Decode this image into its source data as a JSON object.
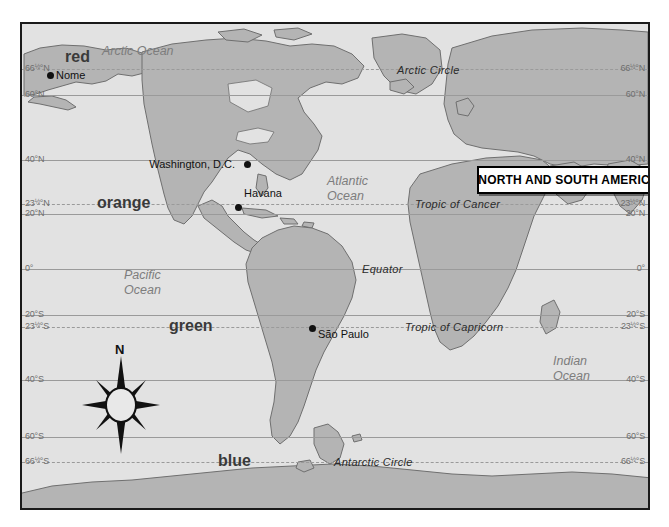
{
  "map": {
    "title": "NORTH AND SOUTH AMERICA",
    "projection_note": "world map, Americas centered",
    "colors": {
      "ocean": "#e2e2e2",
      "land": "#b4b4b4",
      "coastline": "#6f6f6f",
      "gridline": "#9a9a9a",
      "frame": "#1a1a1a",
      "label_gray": "#7d7d7d",
      "text_black": "#111111"
    },
    "latitude_labels": [
      {
        "id": "arctic-circle",
        "text": "66½°N",
        "deg": "66",
        "frac": "½",
        "suffix": "°N",
        "y": 45,
        "dashed": true
      },
      {
        "id": "lat-60n",
        "text": "60°N",
        "deg": "60",
        "frac": "",
        "suffix": "°N",
        "y": 71,
        "dashed": false
      },
      {
        "id": "lat-40n",
        "text": "40°N",
        "deg": "40",
        "frac": "",
        "suffix": "°N",
        "y": 136,
        "dashed": false
      },
      {
        "id": "tropic-cancer",
        "text": "23½°N",
        "deg": "23",
        "frac": "½",
        "suffix": "°N",
        "y": 180,
        "dashed": true
      },
      {
        "id": "lat-20n",
        "text": "20°N",
        "deg": "20",
        "frac": "",
        "suffix": "°N",
        "y": 190,
        "dashed": false
      },
      {
        "id": "equator",
        "text": "0°",
        "deg": "0",
        "frac": "",
        "suffix": "°",
        "y": 245,
        "dashed": false
      },
      {
        "id": "lat-20s",
        "text": "20°S",
        "deg": "20",
        "frac": "",
        "suffix": "°S",
        "y": 291,
        "dashed": false
      },
      {
        "id": "tropic-capricorn",
        "text": "23½°S",
        "deg": "23",
        "frac": "½",
        "suffix": "°S",
        "y": 303,
        "dashed": true
      },
      {
        "id": "lat-40s",
        "text": "40°S",
        "deg": "40",
        "frac": "",
        "suffix": "°S",
        "y": 356,
        "dashed": false
      },
      {
        "id": "lat-60s",
        "text": "60°S",
        "deg": "60",
        "frac": "",
        "suffix": "°S",
        "y": 413,
        "dashed": false
      },
      {
        "id": "antarctic-circle",
        "text": "66½°S",
        "deg": "66",
        "frac": "½",
        "suffix": "°S",
        "y": 438,
        "dashed": true
      }
    ],
    "oceans": [
      {
        "id": "arctic-ocean",
        "name_line1": "Arctic Ocean",
        "name_line2": "",
        "x": 80,
        "y": 20
      },
      {
        "id": "atlantic-ocean",
        "name_line1": "Atlantic",
        "name_line2": "Ocean",
        "x": 305,
        "y": 150
      },
      {
        "id": "pacific-ocean",
        "name_line1": "Pacific",
        "name_line2": "Ocean",
        "x": 102,
        "y": 244
      },
      {
        "id": "indian-ocean",
        "name_line1": "Indian",
        "name_line2": "Ocean",
        "x": 531,
        "y": 330
      }
    ],
    "line_labels": [
      {
        "id": "arctic-circle-label",
        "text": "Arctic Circle",
        "x": 375,
        "y": 40
      },
      {
        "id": "tropic-cancer-label",
        "text": "Tropic of Cancer",
        "x": 393,
        "y": 174
      },
      {
        "id": "equator-label",
        "text": "Equator",
        "x": 340,
        "y": 239
      },
      {
        "id": "tropic-capricorn-label",
        "text": "Tropic of Capricorn",
        "x": 383,
        "y": 297
      },
      {
        "id": "antarctic-circle-label",
        "text": "Antarctic Circle",
        "x": 312,
        "y": 432
      }
    ],
    "color_words": [
      {
        "id": "word-red",
        "text": "red",
        "x": 43,
        "y": 24,
        "color": "#3a3a3a"
      },
      {
        "id": "word-orange",
        "text": "orange",
        "x": 75,
        "y": 170,
        "color": "#3a3a3a"
      },
      {
        "id": "word-green",
        "text": "green",
        "x": 147,
        "y": 293,
        "color": "#3a3a3a"
      },
      {
        "id": "word-blue",
        "text": "blue",
        "x": 196,
        "y": 428,
        "color": "#3a3a3a"
      }
    ],
    "cities": [
      {
        "id": "nome",
        "name": "Nome",
        "x": 25,
        "y": 48,
        "label_side": "right"
      },
      {
        "id": "washington-dc",
        "name": "Washington, D.C.",
        "x": 222,
        "y": 137,
        "label_side": "left"
      },
      {
        "id": "havana",
        "name": "Havana",
        "x": 213,
        "y": 180,
        "label_side": "right",
        "label_dy": -14
      },
      {
        "id": "sao-paulo",
        "name": "São Paulo",
        "x": 287,
        "y": 301,
        "label_side": "right",
        "label_dy": 6
      }
    ],
    "compass": {
      "north_letter": "N"
    }
  }
}
